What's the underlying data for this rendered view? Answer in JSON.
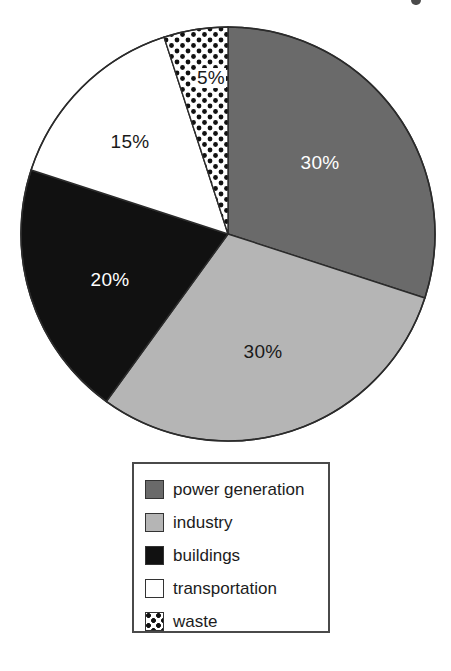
{
  "chart_data": {
    "type": "pie",
    "title": "",
    "categories": [
      "power generation",
      "industry",
      "buildings",
      "transportation",
      "waste"
    ],
    "values": [
      30,
      30,
      20,
      15,
      5
    ],
    "value_unit": "%",
    "data_labels": [
      "30%",
      "30%",
      "20%",
      "15%",
      "5%"
    ],
    "legend_position": "bottom",
    "grid": false,
    "start_angle_deg": 0,
    "direction": "clockwise",
    "colors": [
      "#6a6a6a",
      "#b5b5b5",
      "#111111",
      "#ffffff",
      "#ffffff"
    ],
    "patterns": [
      "solid",
      "solid",
      "solid",
      "solid",
      "dotted"
    ]
  },
  "pie": {
    "slices": [
      {
        "key": "power-generation",
        "label": "power generation",
        "percent": 30,
        "data_label": "30%",
        "fill": "#6a6a6a",
        "pattern": "solid",
        "label_style": "light",
        "label_x": 320,
        "label_y": 163
      },
      {
        "key": "industry",
        "label": "industry",
        "percent": 30,
        "data_label": "30%",
        "fill": "#b5b5b5",
        "pattern": "solid",
        "label_style": "dark",
        "label_x": 263,
        "label_y": 352
      },
      {
        "key": "buildings",
        "label": "buildings",
        "percent": 20,
        "data_label": "20%",
        "fill": "#111111",
        "pattern": "solid",
        "label_style": "light",
        "label_x": 110,
        "label_y": 280
      },
      {
        "key": "transportation",
        "label": "transportation",
        "percent": 15,
        "data_label": "15%",
        "fill": "#ffffff",
        "pattern": "solid",
        "label_style": "dark",
        "label_x": 130,
        "label_y": 142
      },
      {
        "key": "waste",
        "label": "waste",
        "percent": 5,
        "data_label": "5%",
        "fill": "#ffffff",
        "pattern": "dotted",
        "label_style": "boxed",
        "label_x": 211,
        "label_y": 78
      }
    ]
  },
  "legend": {
    "items": [
      {
        "label": "power generation",
        "swatch": "dark-gray-swatch",
        "fill": "#6a6a6a",
        "pattern": "solid"
      },
      {
        "label": "industry",
        "swatch": "light-gray-swatch",
        "fill": "#b5b5b5",
        "pattern": "solid"
      },
      {
        "label": "buildings",
        "swatch": "black-swatch",
        "fill": "#111111",
        "pattern": "solid"
      },
      {
        "label": "transportation",
        "swatch": "white-swatch",
        "fill": "#ffffff",
        "pattern": "solid"
      },
      {
        "label": "waste",
        "swatch": "dotted-swatch",
        "fill": "#ffffff",
        "pattern": "dotted"
      }
    ]
  }
}
